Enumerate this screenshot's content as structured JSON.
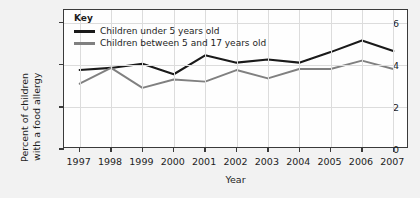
{
  "chart_data": {
    "type": "line",
    "title": "",
    "xlabel": "Year",
    "ylabel": "Percent of children with a food allergy",
    "ylabel_line1": "Percent of children",
    "ylabel_line2": "with a food allergy",
    "categories": [
      "1997",
      "1998",
      "1999",
      "2000",
      "2001",
      "2002",
      "2003",
      "2004",
      "2005",
      "2006",
      "2007"
    ],
    "x": [
      1997,
      1998,
      1999,
      2000,
      2001,
      2002,
      2003,
      2004,
      2005,
      2006,
      2007
    ],
    "xlim": [
      1996.5,
      2007.5
    ],
    "ylim": [
      0,
      6.6
    ],
    "yticks": [
      0,
      2,
      4,
      6
    ],
    "ytick_labels": [
      "0",
      "2",
      "4",
      "6"
    ],
    "grid": true,
    "legend_position": "top-left",
    "legend_title": "Key",
    "series": [
      {
        "name": "Children under 5 years old",
        "color": "#1a1a1a",
        "values": [
          3.75,
          3.85,
          4.05,
          3.55,
          4.45,
          4.1,
          4.25,
          4.1,
          4.6,
          5.15,
          4.65
        ]
      },
      {
        "name": "Children between 5 and 17 years old",
        "color": "#808080",
        "values": [
          3.1,
          3.85,
          2.9,
          3.3,
          3.2,
          3.75,
          3.35,
          3.8,
          3.8,
          4.2,
          3.8
        ]
      }
    ]
  },
  "colors": {
    "page_background": "#f2f2f2",
    "plot_background": "#fefefe",
    "axis": "#3a3a3a",
    "grid": "#dcdcdc",
    "series_1": "#1a1a1a",
    "series_2": "#808080",
    "text": "#1d1d1d"
  }
}
